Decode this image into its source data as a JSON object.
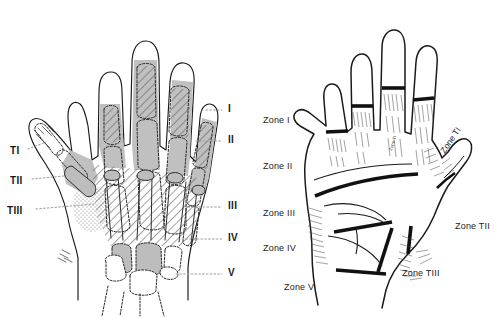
{
  "figure": {
    "background_color": "#ffffff",
    "ink_color": "#1a1a1a",
    "bone_fill_color": "#b8b8b8",
    "hatch_color": "#6e6e6e"
  },
  "panels": {
    "dorsal": {
      "name": "skeletal-hand-dorsal-view",
      "zone_labels_right": [
        {
          "text": "I",
          "x": 228,
          "y": 110
        },
        {
          "text": "II",
          "x": 228,
          "y": 141
        },
        {
          "text": "III",
          "x": 228,
          "y": 207
        },
        {
          "text": "IV",
          "x": 228,
          "y": 239
        },
        {
          "text": "V",
          "x": 228,
          "y": 274
        }
      ],
      "thumb_labels_left": [
        {
          "text": "TI",
          "x": 10,
          "y": 152
        },
        {
          "text": "TII",
          "x": 10,
          "y": 182
        },
        {
          "text": "TIII",
          "x": 7,
          "y": 212
        }
      ]
    },
    "palmar": {
      "name": "palmar-hand-surface-view",
      "zone_labels_left": [
        {
          "text": "Zone I",
          "x": 11,
          "y": 116
        },
        {
          "text": "Zone II",
          "x": 11,
          "y": 162
        },
        {
          "text": "Zone III",
          "x": 11,
          "y": 209
        },
        {
          "text": "Zone IV",
          "x": 11,
          "y": 244
        },
        {
          "text": "Zone V",
          "x": 32,
          "y": 283
        }
      ],
      "thumb_labels": [
        {
          "text": "Zone TI",
          "x": 187,
          "y": 150,
          "rotated": true
        },
        {
          "text": "Zone TII",
          "x": 203,
          "y": 222,
          "rotated": false
        },
        {
          "text": "Zone TIII",
          "x": 150,
          "y": 269,
          "rotated": false
        }
      ],
      "web_micro_label": {
        "text": "Zone TI",
        "x": 137,
        "y": 150
      }
    }
  }
}
